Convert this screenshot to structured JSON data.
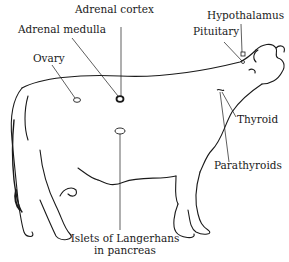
{
  "figure": {
    "labels": {
      "adrenal_cortex": "Adrenal cortex",
      "adrenal_medulla": "Adrenal medulla",
      "ovary": "Ovary",
      "hypothalamus": "Hypothalamus",
      "pituitary": "Pituitary",
      "thyroid": "Thyroid",
      "parathyroids": "Parathyroids",
      "islets_line1": "Islets of Langerhans",
      "islets_line2": "in pancreas"
    }
  }
}
